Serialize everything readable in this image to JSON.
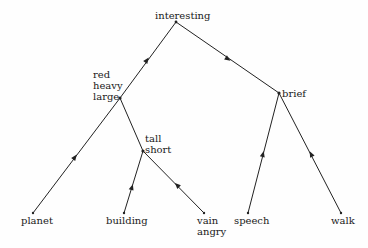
{
  "diagram": {
    "type": "tree",
    "nodes": {
      "root": {
        "label": "interesting"
      },
      "n1": {
        "lines": [
          "red",
          "heavy",
          "large"
        ]
      },
      "n2": {
        "lines": [
          "tall",
          "short"
        ]
      },
      "n3": {
        "label": "brief"
      },
      "leaf_planet": {
        "label": "planet"
      },
      "leaf_building": {
        "label": "building"
      },
      "leaf_vain": {
        "lines": [
          "vain",
          "angry"
        ]
      },
      "leaf_speech": {
        "label": "speech"
      },
      "leaf_walk": {
        "label": "walk"
      }
    },
    "edges": [
      {
        "from": "leaf_planet",
        "to": "n1"
      },
      {
        "from": "n1",
        "to": "root"
      },
      {
        "from": "leaf_building",
        "to": "n2"
      },
      {
        "from": "leaf_vain",
        "to": "n2"
      },
      {
        "from": "n2",
        "to": "n1"
      },
      {
        "from": "leaf_speech",
        "to": "n3"
      },
      {
        "from": "leaf_walk",
        "to": "n3"
      },
      {
        "from": "root",
        "to": "n3"
      }
    ],
    "colors": {
      "line": "#222222",
      "text": "#1a1a1a",
      "background": "#fefefe"
    }
  }
}
